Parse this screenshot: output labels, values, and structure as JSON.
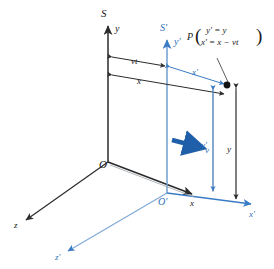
{
  "figure": {
    "type": "galilean-transformation-reference-frames",
    "colors": {
      "frame_s": "#2b2b2b",
      "frame_s_prime": "#3a7cc4",
      "velocity_arrow": "#1f5fa9",
      "point_marker": "#111111",
      "background": "#ffffff"
    },
    "labels": {
      "frame_s": "S",
      "frame_s_prime": "S′",
      "origin_s": "O",
      "origin_s_prime": "O′",
      "axis_y": "y",
      "axis_y_prime": "y′",
      "axis_x": "x",
      "axis_x_prime": "x′",
      "axis_z": "z",
      "axis_z_prime": "z′",
      "velocity": "v",
      "dim_vt": "vt",
      "dim_x": "x",
      "dim_x_prime": "x′",
      "dim_y": "y",
      "dim_y_prime": "y′",
      "point_name": "P",
      "point_eq_top": "y′ = y",
      "point_eq_bottom_lhs": "x′",
      "point_eq_bottom_rhs": "= x − vt",
      "paren_open": "(",
      "paren_close": ")"
    },
    "geometry": {
      "origin_s": [
        108,
        162
      ],
      "origin_s_prime": [
        167,
        193
      ],
      "point_p": [
        227,
        85
      ],
      "y_axis_top": [
        108,
        22
      ],
      "y_prime_axis_top": [
        167,
        36
      ],
      "x_axis_tip": [
        196,
        196
      ],
      "x_prime_axis_tip": [
        255,
        205
      ],
      "z_axis_tip": [
        22,
        222
      ],
      "z_prime_axis_tip": [
        64,
        253
      ]
    }
  }
}
